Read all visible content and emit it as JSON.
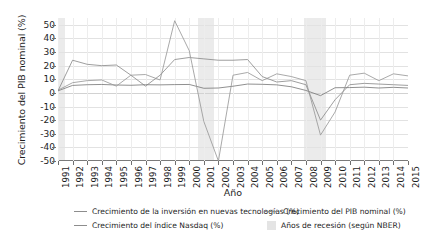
{
  "chart_data": {
    "type": "line",
    "title": "",
    "xlabel": "Año",
    "ylabel": "Crecimiento del PIB nominal (%)",
    "x": [
      1991,
      1992,
      1993,
      1994,
      1995,
      1996,
      1997,
      1998,
      1999,
      2000,
      2001,
      2002,
      2003,
      2004,
      2005,
      2006,
      2007,
      2008,
      2009,
      2010,
      2011,
      2012,
      2013,
      2014,
      2015
    ],
    "xlim": [
      1991,
      2015
    ],
    "ylim": [
      -50,
      55
    ],
    "yticks": [
      -50,
      -40,
      -30,
      -20,
      -10,
      0,
      10,
      20,
      30,
      40,
      50
    ],
    "xtick_labels": [
      "1991",
      "1992",
      "1993",
      "1994",
      "1995",
      "1996",
      "1997",
      "1998",
      "1999",
      "2000",
      "2001",
      "2002",
      "2003",
      "2004",
      "2005",
      "2006",
      "2007",
      "2008",
      "2009",
      "2010",
      "2011",
      "2012",
      "2013",
      "2014",
      "2015"
    ],
    "grid": true,
    "legend_position": "bottom",
    "series": [
      {
        "name": "Crecimiento de la inversión en nuevas tecnologías (%)",
        "color": "#8d8d8d",
        "values": [
          1.5,
          24.0,
          21.0,
          20.0,
          20.5,
          13.0,
          5.0,
          13.0,
          24.5,
          26.0,
          25.0,
          24.0,
          24.0,
          24.5,
          12.0,
          8.0,
          9.0,
          6.0,
          -20.0,
          -5.0,
          6.0,
          7.0,
          6.5,
          6.0,
          5.5
        ]
      },
      {
        "name": "Crecimiento del PIB nominal (%)",
        "color": "#7c7c7c",
        "values": [
          1.5,
          5.5,
          6.0,
          6.2,
          5.8,
          5.6,
          6.0,
          5.9,
          6.1,
          6.2,
          3.4,
          3.6,
          4.9,
          6.5,
          6.3,
          5.9,
          4.5,
          1.8,
          -2.0,
          3.8,
          3.9,
          4.2,
          3.6,
          4.1,
          3.6
        ]
      },
      {
        "name": "Crecimiento del índice Nasdaq (%)",
        "color": "#9a9a9a",
        "values": [
          2.0,
          7.5,
          9.0,
          9.5,
          5.0,
          13.0,
          13.5,
          9.5,
          53.0,
          31.0,
          -21.0,
          -50.0,
          13.0,
          15.0,
          9.0,
          14.0,
          12.0,
          9.0,
          -31.0,
          -14.0,
          13.0,
          14.5,
          9.0,
          14.0,
          12.5
        ]
      }
    ],
    "recession_bands": [
      {
        "label": "1991",
        "start": 1991.0,
        "end": 1991.5
      },
      {
        "label": "2001",
        "start": 2000.6,
        "end": 2001.7
      },
      {
        "label": "2008-2009",
        "start": 2007.9,
        "end": 2009.4
      }
    ]
  },
  "legend": {
    "column1": [
      {
        "label": "Crecimiento de la inversión en nuevas tecnologías (%)",
        "marker": "line"
      },
      {
        "label": "Crecimiento del índice Nasdaq (%)",
        "marker": "line"
      }
    ],
    "column2": [
      {
        "label": "Crecimiento del PIB nominal (%)",
        "marker": "line"
      },
      {
        "label": "Años de recesión (según NBER)",
        "marker": "box"
      }
    ]
  },
  "colors": {
    "axis": "#7a7a7a",
    "grid": "#e2e2e2",
    "recession": "#e8e8e8",
    "background": "#ffffff"
  }
}
